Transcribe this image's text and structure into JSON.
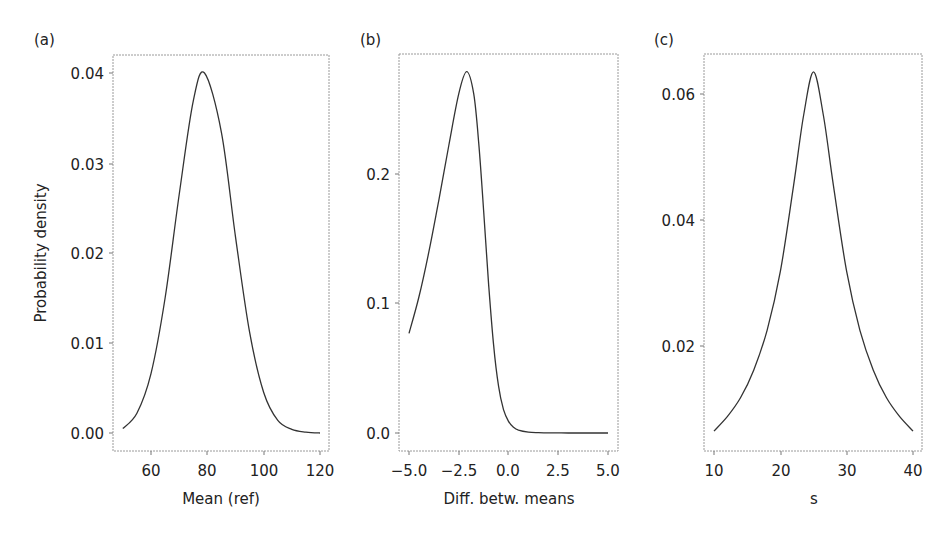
{
  "chart_data": [
    {
      "panel": "(a)",
      "type": "line",
      "title": "",
      "xlabel": "Mean (ref)",
      "ylabel": "Probability density",
      "xlim": [
        50,
        120
      ],
      "ylim": [
        -0.002,
        0.042
      ],
      "xticks": [
        60,
        80,
        100,
        120
      ],
      "xtick_labels": [
        "60",
        "80",
        "100",
        "120"
      ],
      "yticks": [
        0.0,
        0.01,
        0.02,
        0.03,
        0.04
      ],
      "ytick_labels": [
        "0.00",
        "0.01",
        "0.02",
        "0.03",
        "0.04"
      ],
      "grid": false,
      "legend": null,
      "x": [
        50,
        55,
        60,
        65,
        70,
        75,
        79,
        85,
        90,
        95,
        100,
        105,
        110,
        115,
        120
      ],
      "y": [
        0.0005,
        0.0022,
        0.0066,
        0.015,
        0.0265,
        0.0369,
        0.04,
        0.0334,
        0.0218,
        0.0112,
        0.0045,
        0.0014,
        0.0004,
        0.0001,
        0.0
      ]
    },
    {
      "panel": "(b)",
      "type": "line",
      "title": "",
      "xlabel": "Diff. betw. means",
      "ylabel": "",
      "xlim": [
        -5.0,
        5.0
      ],
      "ylim": [
        -0.014,
        0.295
      ],
      "xticks": [
        -5.0,
        -2.5,
        0.0,
        2.5,
        5.0
      ],
      "xtick_labels": [
        "−5.0",
        "−2.5",
        "0.0",
        "2.5",
        "5.0"
      ],
      "yticks": [
        0.0,
        0.1,
        0.2
      ],
      "ytick_labels": [
        "0.0",
        "0.1",
        "0.2"
      ],
      "grid": false,
      "legend": null,
      "x": [
        -5.0,
        -4.5,
        -4.0,
        -3.5,
        -3.0,
        -2.5,
        -2.1,
        -1.75,
        -1.5,
        -1.25,
        -1.0,
        -0.75,
        -0.5,
        -0.25,
        0.0,
        0.25,
        0.5,
        1.0,
        1.5,
        2.0,
        3.0,
        4.0,
        5.0
      ],
      "y": [
        0.077,
        0.105,
        0.14,
        0.18,
        0.222,
        0.262,
        0.279,
        0.262,
        0.225,
        0.172,
        0.115,
        0.068,
        0.036,
        0.018,
        0.009,
        0.0045,
        0.0022,
        0.0006,
        0.0002,
        0.0001,
        0.0,
        0.0,
        0.0
      ]
    },
    {
      "panel": "(c)",
      "type": "line",
      "title": "",
      "xlabel": "s",
      "ylabel": "",
      "xlim": [
        8.5,
        41.5
      ],
      "ylim": [
        0.003,
        0.0665
      ],
      "xticks": [
        10,
        20,
        30,
        40
      ],
      "xtick_labels": [
        "10",
        "20",
        "30",
        "40"
      ],
      "yticks": [
        0.02,
        0.04,
        0.06
      ],
      "ytick_labels": [
        "0.02",
        "0.04",
        "0.06"
      ],
      "grid": false,
      "legend": null,
      "x": [
        10,
        12,
        14,
        16,
        18,
        20,
        22,
        23.5,
        25,
        26.5,
        28,
        30,
        32,
        34,
        36,
        38,
        40
      ],
      "y": [
        0.0065,
        0.0088,
        0.0118,
        0.0162,
        0.0225,
        0.0318,
        0.0455,
        0.0565,
        0.0635,
        0.0565,
        0.0455,
        0.0318,
        0.0225,
        0.0162,
        0.0118,
        0.0088,
        0.0065
      ]
    }
  ],
  "panels": {
    "a": {
      "label": "(a)",
      "ylabel": "Probability density",
      "xlabel": "Mean (ref)",
      "xticks": [
        "60",
        "80",
        "100",
        "120"
      ],
      "yticks": [
        "0.00",
        "0.01",
        "0.02",
        "0.03",
        "0.04"
      ]
    },
    "b": {
      "label": "(b)",
      "xlabel": "Diff. betw. means",
      "xticks": [
        "−5.0",
        "−2.5",
        "0.0",
        "2.5",
        "5.0"
      ],
      "yticks": [
        "0.0",
        "0.1",
        "0.2"
      ]
    },
    "c": {
      "label": "(c)",
      "xlabel": "s",
      "xticks": [
        "10",
        "20",
        "30",
        "40"
      ],
      "yticks": [
        "0.02",
        "0.04",
        "0.06"
      ]
    }
  },
  "colors": {
    "curve": "#333333",
    "frame": "#9a9a9a",
    "text": "#222222"
  }
}
